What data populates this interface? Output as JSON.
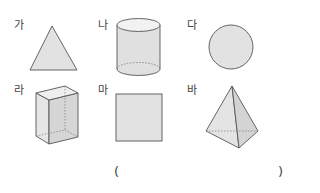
{
  "shapes": [
    {
      "label": "가",
      "name": "triangle"
    },
    {
      "label": "나",
      "name": "cylinder"
    },
    {
      "label": "다",
      "name": "circle"
    },
    {
      "label": "라",
      "name": "rectangular-prism"
    },
    {
      "label": "마",
      "name": "square"
    },
    {
      "label": "바",
      "name": "triangular-pyramid"
    }
  ],
  "answer": {
    "open_paren": "(",
    "close_paren": ")",
    "value": ""
  },
  "colors": {
    "fill": "#e2e2e2",
    "fill_dark": "#d2d2d2",
    "stroke": "#555555"
  }
}
